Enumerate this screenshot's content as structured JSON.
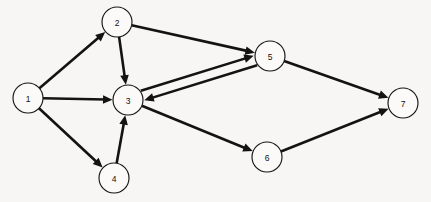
{
  "diagram": {
    "background_color": "#f7f6f4",
    "node_fill_color": "#fbfaf8",
    "stroke_color": "#131313",
    "node_radius": 15,
    "width": 431,
    "height": 202,
    "nodes": [
      {
        "id": "1",
        "label": "1",
        "x": 28,
        "y": 98
      },
      {
        "id": "2",
        "label": "2",
        "x": 117,
        "y": 22
      },
      {
        "id": "3",
        "label": "3",
        "x": 128,
        "y": 100
      },
      {
        "id": "4",
        "label": "4",
        "x": 114,
        "y": 178
      },
      {
        "id": "5",
        "label": "5",
        "x": 270,
        "y": 56
      },
      {
        "id": "6",
        "label": "6",
        "x": 267,
        "y": 157
      },
      {
        "id": "7",
        "label": "7",
        "x": 403,
        "y": 103
      }
    ],
    "edges": [
      {
        "from": "1",
        "to": "2",
        "directed": true,
        "offset": 0
      },
      {
        "from": "1",
        "to": "3",
        "directed": true,
        "offset": 0
      },
      {
        "from": "1",
        "to": "4",
        "directed": true,
        "offset": 0
      },
      {
        "from": "2",
        "to": "3",
        "directed": true,
        "offset": 0
      },
      {
        "from": "2",
        "to": "5",
        "directed": true,
        "offset": 0
      },
      {
        "from": "3",
        "to": "5",
        "directed": true,
        "offset": -5
      },
      {
        "from": "5",
        "to": "3",
        "directed": true,
        "offset": -5
      },
      {
        "from": "4",
        "to": "3",
        "directed": true,
        "offset": 0
      },
      {
        "from": "3",
        "to": "6",
        "directed": true,
        "offset": 0
      },
      {
        "from": "5",
        "to": "7",
        "directed": true,
        "offset": 0
      },
      {
        "from": "6",
        "to": "7",
        "directed": true,
        "offset": 0
      }
    ]
  }
}
